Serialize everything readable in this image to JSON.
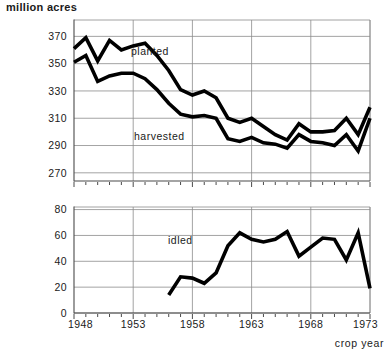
{
  "chart_data": {
    "type": "line",
    "title": "million acres",
    "ylabel": "million acres",
    "xlabel": "crop year",
    "grid": true,
    "legend_position": "inline-annotation",
    "panels": [
      {
        "name": "acreage-panel",
        "ylim": [
          264,
          382
        ],
        "yticks": [
          270,
          290,
          310,
          330,
          350,
          370
        ],
        "ytick_labels": [
          "270",
          "290",
          "310",
          "330",
          "350",
          "370"
        ],
        "xlim": [
          1948,
          1973
        ],
        "series": [
          {
            "name": "planted",
            "label": "planted",
            "x": [
              1948,
              1949,
              1950,
              1951,
              1952,
              1953,
              1954,
              1955,
              1956,
              1957,
              1958,
              1959,
              1960,
              1961,
              1962,
              1963,
              1964,
              1965,
              1966,
              1967,
              1968,
              1969,
              1970,
              1971,
              1972,
              1973
            ],
            "values": [
              361,
              369,
              352,
              367,
              360,
              363,
              365,
              356,
              345,
              331,
              327,
              330,
              325,
              310,
              307,
              310,
              304,
              298,
              294,
              306,
              300,
              300,
              301,
              310,
              298,
              318
            ]
          },
          {
            "name": "harvested",
            "label": "harvested",
            "x": [
              1948,
              1949,
              1950,
              1951,
              1952,
              1953,
              1954,
              1955,
              1956,
              1957,
              1958,
              1959,
              1960,
              1961,
              1962,
              1963,
              1964,
              1965,
              1966,
              1967,
              1968,
              1969,
              1970,
              1971,
              1972,
              1973
            ],
            "values": [
              351,
              356,
              337,
              341,
              343,
              343,
              339,
              331,
              321,
              313,
              311,
              312,
              310,
              295,
              293,
              296,
              292,
              291,
              288,
              298,
              293,
              292,
              290,
              298,
              286,
              310
            ]
          }
        ]
      },
      {
        "name": "idled-panel",
        "ylim": [
          0,
          82
        ],
        "yticks": [
          0,
          20,
          40,
          60,
          80
        ],
        "ytick_labels": [
          "0",
          "20",
          "40",
          "60",
          "80"
        ],
        "xlim": [
          1948,
          1973
        ],
        "series": [
          {
            "name": "idled",
            "label": "idled",
            "x": [
              1956,
              1957,
              1958,
              1959,
              1960,
              1961,
              1962,
              1963,
              1964,
              1965,
              1966,
              1967,
              1968,
              1969,
              1970,
              1971,
              1972,
              1973
            ],
            "values": [
              14,
              28,
              27,
              23,
              31,
              52,
              62,
              57,
              55,
              57,
              63,
              44,
              51,
              58,
              57,
              41,
              62,
              19
            ]
          }
        ]
      }
    ],
    "xticks": [
      1948,
      1953,
      1958,
      1963,
      1968,
      1973
    ],
    "xtick_labels": [
      "1948",
      "1953",
      "1958",
      "1963",
      "1968",
      "1973"
    ],
    "xminor_step": 1
  },
  "labels": {
    "planted": "planted",
    "harvested": "harvested",
    "idled": "idled",
    "y_axis_title": "million acres",
    "x_axis_title": "crop year"
  },
  "colors": {
    "data_line": "#000000",
    "grid": "#8c8c8c",
    "axis": "#4a4a4a",
    "text": "#1a1a1a",
    "background": "#ffffff"
  }
}
